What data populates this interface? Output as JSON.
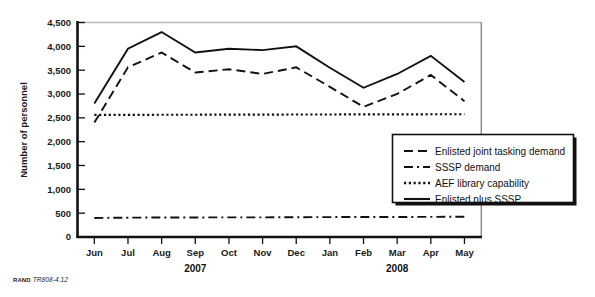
{
  "figure": {
    "footer_brand": "RAND",
    "footer_code": "TR808-4.12"
  },
  "chart_data": {
    "type": "line",
    "title": "",
    "xlabel": "",
    "ylabel": "Number of personnel",
    "ylim": [
      0,
      4500
    ],
    "ytick_values": [
      0,
      500,
      1000,
      1500,
      2000,
      2500,
      3000,
      3500,
      4000,
      4500
    ],
    "ytick_labels": [
      "0",
      "500",
      "1,000",
      "1,500",
      "2,000",
      "2,500",
      "3,000",
      "3,500",
      "4,000",
      "4,500"
    ],
    "categories": [
      "Jun",
      "Jul",
      "Aug",
      "Sep",
      "Oct",
      "Nov",
      "Dec",
      "Jan",
      "Feb",
      "Mar",
      "Apr",
      "May"
    ],
    "group_labels": [
      {
        "label": "2007",
        "start_index": 0,
        "end_index": 6
      },
      {
        "label": "2008",
        "start_index": 7,
        "end_index": 11
      }
    ],
    "grid": false,
    "legend_position": "bottom-right-outside",
    "series": [
      {
        "name": "Enlisted joint tasking demand",
        "style": "dashed",
        "color": "#111111",
        "values": [
          2400,
          3560,
          3870,
          3450,
          3520,
          3420,
          3560,
          3150,
          2730,
          3000,
          3400,
          2850
        ]
      },
      {
        "name": "SSSP demand",
        "style": "dash-dot",
        "color": "#111111",
        "values": [
          400,
          405,
          410,
          410,
          412,
          412,
          415,
          418,
          420,
          420,
          422,
          425
        ]
      },
      {
        "name": "AEF library capability",
        "style": "dotted",
        "color": "#111111",
        "values": [
          2560,
          2562,
          2565,
          2565,
          2568,
          2568,
          2570,
          2570,
          2572,
          2572,
          2575,
          2575
        ]
      },
      {
        "name": "Enlisted plus SSSP",
        "style": "solid",
        "color": "#111111",
        "values": [
          2800,
          3950,
          4300,
          3870,
          3950,
          3920,
          4000,
          3550,
          3130,
          3420,
          3800,
          3250
        ]
      }
    ]
  }
}
